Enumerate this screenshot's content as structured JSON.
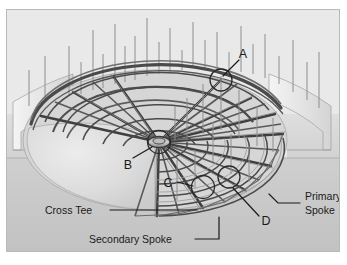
{
  "figure": {
    "type": "technical-illustration",
    "frame": {
      "background_color": "#e9e9e9",
      "border_color": "#b9b9b9",
      "page_background": "#ffffff"
    },
    "palette": {
      "sky": "#e9e9e9",
      "ground_upper": "#d8d8d8",
      "ground_lower": "#c9c9c9",
      "wall_highlight": "#f2f2f2",
      "membrane_light": "#e4e4e4",
      "membrane_mid": "#d2d2d2",
      "member_dark": "#3a3a3a",
      "member_mid": "#6e6e6e",
      "rod_color": "#8a8a8a",
      "leader_color": "#1a1a1a",
      "text_color": "#1a1a1a"
    }
  },
  "callouts": {
    "letters": [
      {
        "id": "A",
        "label": "A",
        "x": 236,
        "y": 44,
        "target_x": 214,
        "target_y": 70
      },
      {
        "id": "B",
        "label": "B",
        "x": 121,
        "y": 155,
        "target_x": 152,
        "target_y": 134
      },
      {
        "id": "C",
        "label": "C",
        "x": 161,
        "y": 175,
        "target_x": 196,
        "target_y": 177
      },
      {
        "id": "D",
        "label": "D",
        "x": 259,
        "y": 213,
        "target_x": 222,
        "target_y": 173
      }
    ],
    "terms": [
      {
        "id": "cross-tee",
        "label": "Cross Tee",
        "lines": [
          "Cross Tee"
        ],
        "x": 44,
        "y": 203,
        "leader": "M 103,200 L 190,200"
      },
      {
        "id": "secondary-spoke",
        "label": "Secondary Spoke",
        "lines": [
          "Secondary Spoke"
        ],
        "x": 88,
        "y": 233,
        "leader": "M 188,229 L 212,229 L 212,207"
      },
      {
        "id": "primary-spoke",
        "label": "Primary Spoke",
        "lines": [
          "Primary",
          "Spoke"
        ],
        "x": 297,
        "y": 196,
        "leader": "M 293,193 L 271,193 L 262,184"
      }
    ]
  }
}
